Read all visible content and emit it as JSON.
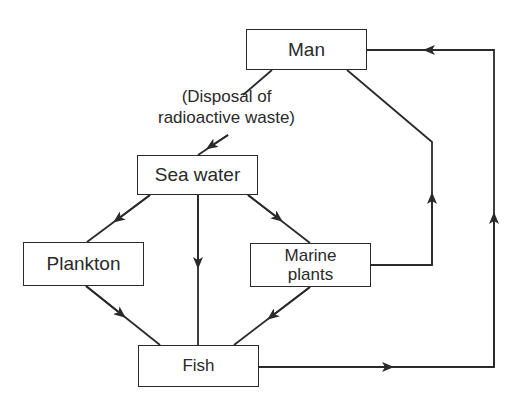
{
  "diagram": {
    "type": "flow",
    "nodes": [
      {
        "id": "man",
        "label": "Man"
      },
      {
        "id": "sea_water",
        "label": "Sea water"
      },
      {
        "id": "plankton",
        "label": "Plankton"
      },
      {
        "id": "marine_plants",
        "label": "Marine plants",
        "label_line1": "Marine",
        "label_line2": "plants"
      },
      {
        "id": "fish",
        "label": "Fish"
      }
    ],
    "annotation": {
      "line1": "(Disposal of",
      "line2": "radioactive waste)"
    },
    "edges": [
      {
        "from": "man",
        "to": "sea_water",
        "label": "(Disposal of radioactive waste)"
      },
      {
        "from": "sea_water",
        "to": "plankton"
      },
      {
        "from": "sea_water",
        "to": "fish"
      },
      {
        "from": "sea_water",
        "to": "marine_plants"
      },
      {
        "from": "plankton",
        "to": "fish"
      },
      {
        "from": "marine_plants",
        "to": "fish"
      },
      {
        "from": "marine_plants",
        "to": "man"
      },
      {
        "from": "fish",
        "to": "man"
      }
    ],
    "colors": {
      "stroke": "#2a2a2a",
      "background": "#ffffff"
    }
  }
}
